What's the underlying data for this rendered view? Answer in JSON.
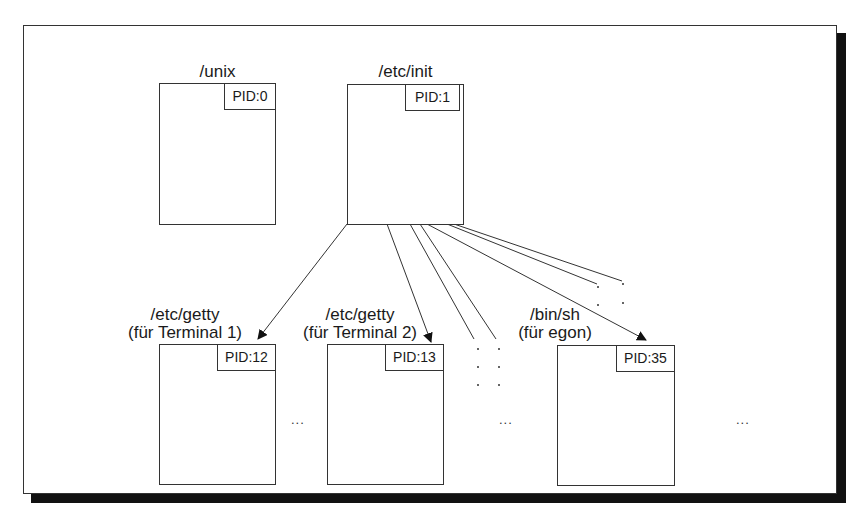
{
  "diagram": {
    "root_processes": [
      {
        "name": "/unix",
        "pid": "PID:0"
      },
      {
        "name": "/etc/init",
        "pid": "PID:1"
      }
    ],
    "child_processes": [
      {
        "name_line1": "/etc/getty",
        "name_line2": "(für Terminal 1)",
        "pid": "PID:12"
      },
      {
        "name_line1": "/etc/getty",
        "name_line2": "(für Terminal 2)",
        "pid": "PID:13"
      },
      {
        "name_line1": "/bin/sh",
        "name_line2": "(für egon)",
        "pid": "PID:35"
      }
    ],
    "ellipses": [
      "...",
      "...",
      "..."
    ],
    "edges": [
      {
        "from": "/etc/init",
        "to": "/etc/getty (für Terminal 1)",
        "arrow": true
      },
      {
        "from": "/etc/init",
        "to": "/etc/getty (für Terminal 2)",
        "arrow": true
      },
      {
        "from": "/etc/init",
        "to": "/bin/sh (für egon)",
        "arrow": true
      },
      {
        "from": "/etc/init",
        "to": "weitere Prozesse (gepunktet)",
        "arrow": false
      }
    ]
  }
}
